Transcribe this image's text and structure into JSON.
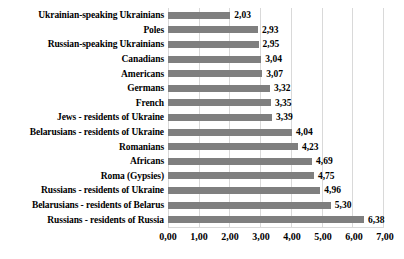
{
  "chart_data": {
    "type": "bar",
    "orientation": "horizontal",
    "title": "",
    "xlabel": "",
    "ylabel": "",
    "xlim": [
      0,
      7
    ],
    "grid": true,
    "legend": false,
    "categories": [
      "Ukrainian-speaking Ukrainians",
      "Poles",
      "Russian-speaking Ukrainians",
      "Canadians",
      "Americans",
      "Germans",
      "French",
      "Jews - residents of Ukraine",
      "Belarusians - residents of Ukraine",
      "Romanians",
      "Africans",
      "Roma (Gypsies)",
      "Russians - residents of Ukraine",
      "Belarusians - residents of Belarus",
      "Russians - residents of Russia"
    ],
    "values": [
      2.03,
      2.93,
      2.95,
      3.04,
      3.07,
      3.32,
      3.35,
      3.39,
      4.04,
      4.23,
      4.69,
      4.75,
      4.96,
      5.3,
      6.38
    ],
    "value_labels": [
      "2,03",
      "2,93",
      "2,95",
      "3,04",
      "3,07",
      "3,32",
      "3,35",
      "3,39",
      "4,04",
      "4,23",
      "4,69",
      "4,75",
      "4,96",
      "5,30",
      "6,38"
    ],
    "x_ticks": [
      "0,00",
      "1,00",
      "2,00",
      "3,00",
      "4,00",
      "5,00",
      "6,00",
      "7,00"
    ]
  },
  "colors": {
    "bar": "#7f7f7f",
    "gridline": "#d9d9d9",
    "text": "#000000"
  }
}
